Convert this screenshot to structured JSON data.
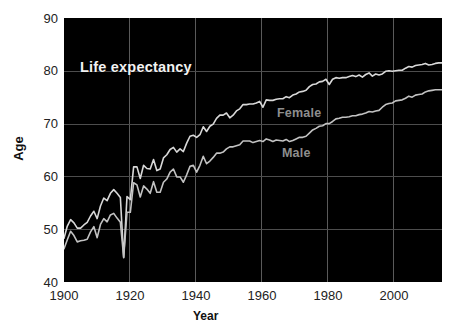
{
  "chart_data": {
    "type": "line",
    "title": "Life expectancy",
    "xlabel": "Year",
    "ylabel": "Age",
    "xlim": [
      1900,
      2014
    ],
    "ylim": [
      40,
      90
    ],
    "xticks": [
      1900,
      1920,
      1940,
      1960,
      1980,
      2000
    ],
    "yticks": [
      40,
      50,
      60,
      70,
      80,
      90
    ],
    "grid": true,
    "legend_position": "inline-annotation",
    "background": "#000000",
    "line_color": "#d8d8d8",
    "label_color": "#8e8e8e",
    "title_color": "#f2f2f2",
    "series": [
      {
        "name": "Female",
        "x": [
          1900,
          1901,
          1902,
          1903,
          1904,
          1905,
          1906,
          1907,
          1908,
          1909,
          1910,
          1911,
          1912,
          1913,
          1914,
          1915,
          1916,
          1917,
          1918,
          1919,
          1920,
          1921,
          1922,
          1923,
          1924,
          1925,
          1926,
          1927,
          1928,
          1929,
          1930,
          1931,
          1932,
          1933,
          1934,
          1935,
          1936,
          1937,
          1938,
          1939,
          1940,
          1941,
          1942,
          1943,
          1944,
          1945,
          1946,
          1947,
          1948,
          1949,
          1950,
          1951,
          1952,
          1953,
          1954,
          1955,
          1956,
          1957,
          1958,
          1959,
          1960,
          1961,
          1962,
          1963,
          1964,
          1965,
          1966,
          1967,
          1968,
          1969,
          1970,
          1971,
          1972,
          1973,
          1974,
          1975,
          1976,
          1977,
          1978,
          1979,
          1980,
          1981,
          1982,
          1983,
          1984,
          1985,
          1986,
          1987,
          1988,
          1989,
          1990,
          1991,
          1992,
          1993,
          1994,
          1995,
          1996,
          1997,
          1998,
          1999,
          2000,
          2001,
          2002,
          2003,
          2004,
          2005,
          2006,
          2007,
          2008,
          2009,
          2010,
          2011,
          2012,
          2013,
          2014
        ],
        "values": [
          48.3,
          50.6,
          51.8,
          51.2,
          50.2,
          50.2,
          50.8,
          51.3,
          52.5,
          53.4,
          52.0,
          54.4,
          55.9,
          55.4,
          56.8,
          57.5,
          56.8,
          56.0,
          44.6,
          56.2,
          55.6,
          61.8,
          61.8,
          59.6,
          62.1,
          61.5,
          61.4,
          63.2,
          61.1,
          61.4,
          63.5,
          64.1,
          65.1,
          65.5,
          64.6,
          65.2,
          64.7,
          66.3,
          67.6,
          67.8,
          67.4,
          67.9,
          69.4,
          68.5,
          69.5,
          69.9,
          71.0,
          71.6,
          71.6,
          72.0,
          71.1,
          71.6,
          72.4,
          72.8,
          73.6,
          73.6,
          73.7,
          73.7,
          73.9,
          74.2,
          73.1,
          74.5,
          74.4,
          74.4,
          74.6,
          74.7,
          74.7,
          75.1,
          74.9,
          75.4,
          75.6,
          76.0,
          76.1,
          76.3,
          77.0,
          77.4,
          77.5,
          77.9,
          78.0,
          78.4,
          77.4,
          78.4,
          78.7,
          78.6,
          78.7,
          78.7,
          78.9,
          79.1,
          78.9,
          79.2,
          78.8,
          79.3,
          79.6,
          79.0,
          79.4,
          79.2,
          79.4,
          79.9,
          80.0,
          79.9,
          80.0,
          80.1,
          80.1,
          80.5,
          80.8,
          80.7,
          81.0,
          81.1,
          81.2,
          81.4,
          81.1,
          81.2,
          81.4,
          81.5,
          81.5
        ]
      },
      {
        "name": "Male",
        "x": [
          1900,
          1901,
          1902,
          1903,
          1904,
          1905,
          1906,
          1907,
          1908,
          1909,
          1910,
          1911,
          1912,
          1913,
          1914,
          1915,
          1916,
          1917,
          1918,
          1919,
          1920,
          1921,
          1922,
          1923,
          1924,
          1925,
          1926,
          1927,
          1928,
          1929,
          1930,
          1931,
          1932,
          1933,
          1934,
          1935,
          1936,
          1937,
          1938,
          1939,
          1940,
          1941,
          1942,
          1943,
          1944,
          1945,
          1946,
          1947,
          1948,
          1949,
          1950,
          1951,
          1952,
          1953,
          1954,
          1955,
          1956,
          1957,
          1958,
          1959,
          1960,
          1961,
          1962,
          1963,
          1964,
          1965,
          1966,
          1967,
          1968,
          1969,
          1970,
          1971,
          1972,
          1973,
          1974,
          1975,
          1976,
          1977,
          1978,
          1979,
          1980,
          1981,
          1982,
          1983,
          1984,
          1985,
          1986,
          1987,
          1988,
          1989,
          1990,
          1991,
          1992,
          1993,
          1994,
          1995,
          1996,
          1997,
          1998,
          1999,
          2000,
          2001,
          2002,
          2003,
          2004,
          2005,
          2006,
          2007,
          2008,
          2009,
          2010,
          2011,
          2012,
          2013,
          2014
        ],
        "values": [
          46.3,
          48.0,
          49.6,
          48.8,
          47.6,
          47.8,
          47.9,
          48.1,
          49.5,
          50.5,
          48.4,
          50.9,
          52.0,
          51.4,
          52.7,
          53.0,
          52.1,
          51.3,
          44.7,
          53.2,
          53.2,
          58.8,
          58.4,
          56.1,
          58.2,
          57.6,
          56.8,
          59.0,
          57.0,
          57.0,
          58.9,
          59.5,
          60.8,
          61.4,
          59.9,
          59.9,
          58.9,
          60.3,
          61.9,
          62.1,
          60.8,
          62.1,
          63.8,
          62.4,
          62.9,
          63.6,
          64.4,
          64.4,
          64.6,
          65.2,
          65.6,
          65.6,
          65.8,
          66.0,
          66.7,
          66.7,
          66.7,
          66.4,
          66.6,
          66.8,
          66.6,
          67.1,
          66.9,
          66.6,
          66.9,
          66.8,
          66.7,
          67.0,
          66.6,
          66.8,
          67.1,
          67.4,
          67.4,
          67.6,
          68.2,
          68.8,
          69.1,
          69.5,
          69.6,
          70.0,
          70.0,
          70.4,
          70.9,
          71.0,
          71.2,
          71.2,
          71.3,
          71.5,
          71.5,
          71.7,
          71.8,
          72.0,
          72.3,
          72.2,
          72.4,
          72.5,
          73.1,
          73.6,
          73.8,
          73.9,
          74.3,
          74.4,
          74.5,
          74.8,
          75.2,
          75.0,
          75.4,
          75.5,
          75.6,
          76.0,
          76.2,
          76.3,
          76.4,
          76.4,
          76.4
        ]
      }
    ]
  },
  "axes": {
    "y_tick_labels": [
      "90",
      "80",
      "70",
      "60",
      "50",
      "40"
    ],
    "x_tick_labels": [
      "1900",
      "1920",
      "1940",
      "1960",
      "1980",
      "2000"
    ],
    "y_axis_title": "Age",
    "x_axis_title": "Year"
  },
  "annotations": {
    "title": "Life expectancy",
    "female_label": "Female",
    "male_label": "Male"
  }
}
